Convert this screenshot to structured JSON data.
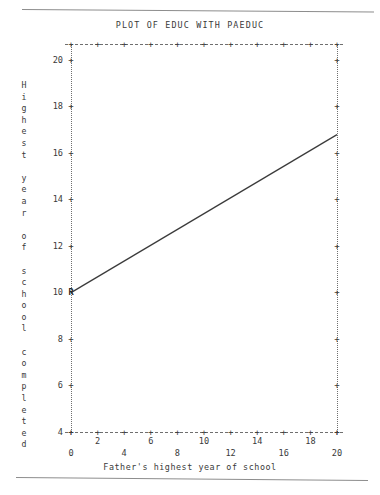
{
  "chart_data": {
    "type": "line",
    "title": "PLOT OF EDUC WITH PAEDUC",
    "xlabel": "Father's highest year of school",
    "ylabel": "Highest year of school completed",
    "xlim": [
      0,
      20
    ],
    "ylim": [
      4,
      20.7
    ],
    "grid": false,
    "legend": null,
    "x_ticks": [
      0,
      2,
      4,
      6,
      8,
      10,
      12,
      14,
      16,
      18,
      20
    ],
    "x_tick_labels": [
      "0",
      "2",
      "4",
      "6",
      "8",
      "10",
      "12",
      "14",
      "16",
      "18",
      "20"
    ],
    "y_ticks": [
      4,
      6,
      8,
      10,
      12,
      14,
      16,
      18,
      20
    ],
    "y_tick_labels": [
      "4",
      "6",
      "8",
      "10",
      "12",
      "14",
      "16",
      "18",
      "20"
    ],
    "series": [
      {
        "name": "Regression line",
        "marker": "R",
        "x": [
          0,
          20
        ],
        "values": [
          10.0,
          16.8
        ]
      }
    ],
    "markers": [
      {
        "label": "R",
        "x": 0,
        "y": 10.0
      },
      {
        "label": "R",
        "x": 20,
        "y": 16.8
      }
    ],
    "tick_glyph": "+",
    "axis_style": "dotted-ascii"
  },
  "ylabel_chars": [
    "H",
    "i",
    "g",
    "h",
    "e",
    "s",
    "t",
    "",
    "y",
    "e",
    "a",
    "r",
    "",
    "o",
    "f",
    "",
    "s",
    "c",
    "h",
    "o",
    "o",
    "l",
    "",
    "c",
    "o",
    "m",
    "p",
    "l",
    "e",
    "t",
    "e",
    "d"
  ]
}
